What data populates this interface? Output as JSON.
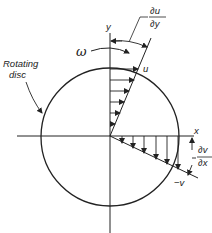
{
  "diagram": {
    "labels": {
      "rotating_disc": [
        "Rotating",
        "disc"
      ],
      "omega": "ω",
      "y_axis": "y",
      "x_axis": "x",
      "u": "u",
      "minus_v": "−v",
      "du_dy_num": "∂u",
      "du_dy_den": "∂y",
      "dv_dx_num": "∂v",
      "dv_dx_den": "∂x"
    },
    "colors": {
      "stroke": "#222222",
      "background": "#ffffff"
    }
  }
}
